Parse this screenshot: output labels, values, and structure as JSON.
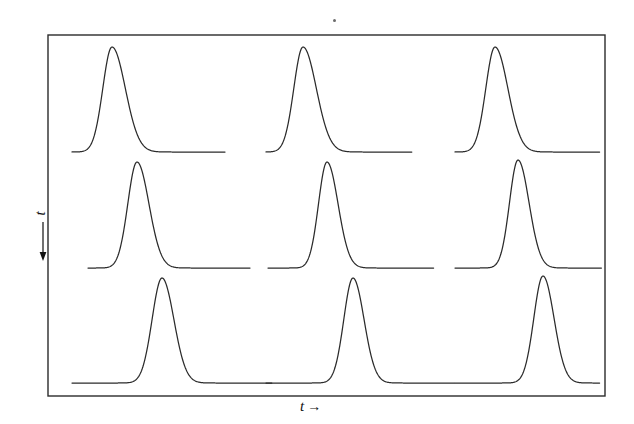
{
  "figure": {
    "background_color": "#ffffff",
    "line_color": "#2b2b2b",
    "frame": {
      "x": 48,
      "y": 35,
      "width": 557,
      "height": 361,
      "stroke_width": 1.4
    },
    "speck_mark": {
      "x": 333,
      "y": 19,
      "label": "ink-speck"
    }
  },
  "axes": {
    "x_label": "t",
    "x_arrow": "→",
    "y_label": "t",
    "y_arrow": "↑"
  },
  "chart_data": {
    "type": "line",
    "title": "",
    "subtitle": "",
    "xlabel": "t",
    "ylabel": "t",
    "grid": false,
    "legend": "none",
    "axis_ticks": [],
    "panel_rows": 3,
    "panel_cols": 3,
    "xlim": [
      48,
      605
    ],
    "ylim": [
      35,
      396
    ],
    "series": [
      {
        "name": "pulse-r1c1",
        "row": 1,
        "col": 1,
        "peak_x": 112,
        "peak_y": 47,
        "baseline_y": 152,
        "trace_start_x": 72,
        "trace_end_x": 225,
        "width": 13,
        "skew": 1.45
      },
      {
        "name": "pulse-r1c2",
        "row": 1,
        "col": 2,
        "peak_x": 303,
        "peak_y": 47,
        "baseline_y": 152,
        "trace_start_x": 266,
        "trace_end_x": 412,
        "width": 13,
        "skew": 1.45
      },
      {
        "name": "pulse-r1c3",
        "row": 1,
        "col": 3,
        "peak_x": 495,
        "peak_y": 47,
        "baseline_y": 152,
        "trace_start_x": 455,
        "trace_end_x": 600,
        "width": 13,
        "skew": 1.4
      },
      {
        "name": "pulse-r2c1",
        "row": 2,
        "col": 1,
        "peak_x": 137,
        "peak_y": 162,
        "baseline_y": 268,
        "trace_start_x": 88,
        "trace_end_x": 250,
        "width": 13,
        "skew": 1.3
      },
      {
        "name": "pulse-r2c2",
        "row": 2,
        "col": 2,
        "peak_x": 327,
        "peak_y": 162,
        "baseline_y": 268,
        "trace_start_x": 268,
        "trace_end_x": 434,
        "width": 12,
        "skew": 1.3
      },
      {
        "name": "pulse-r2c3",
        "row": 2,
        "col": 3,
        "peak_x": 518,
        "peak_y": 160,
        "baseline_y": 268,
        "trace_start_x": 455,
        "trace_end_x": 602,
        "width": 12,
        "skew": 1.3
      },
      {
        "name": "pulse-r3c1",
        "row": 3,
        "col": 1,
        "peak_x": 162,
        "peak_y": 278,
        "baseline_y": 383,
        "trace_start_x": 72,
        "trace_end_x": 272,
        "width": 14,
        "skew": 1.2
      },
      {
        "name": "pulse-r3c2",
        "row": 3,
        "col": 2,
        "peak_x": 353,
        "peak_y": 278,
        "baseline_y": 383,
        "trace_start_x": 266,
        "trace_end_x": 455,
        "width": 13,
        "skew": 1.2
      },
      {
        "name": "pulse-r3c3",
        "row": 3,
        "col": 3,
        "peak_x": 543,
        "peak_y": 276,
        "baseline_y": 383,
        "trace_start_x": 455,
        "trace_end_x": 600,
        "width": 13,
        "skew": 1.2
      }
    ]
  }
}
